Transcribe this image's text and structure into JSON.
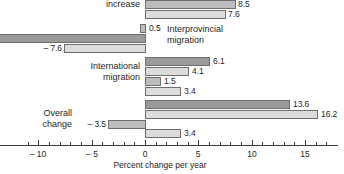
{
  "chart_data": {
    "type": "bar",
    "orientation": "horizontal",
    "title": "",
    "xlabel": "Percent change per year",
    "ylabel": "",
    "xlim": [
      -11.5,
      17.2
    ],
    "grid": false,
    "legend": "none",
    "tick_labels": [
      "-10",
      "-5",
      "0",
      "5",
      "10",
      "15"
    ],
    "tick_values": [
      -10,
      -5,
      0,
      5,
      10,
      15
    ],
    "minor_tick_step": 1,
    "zero_line": 0,
    "categories": [
      "increase",
      "Interprovincial migration",
      "International migration",
      "Overall change"
    ],
    "groups": [
      {
        "label": "increase",
        "label_side": "left",
        "clipped_top": true,
        "bars": [
          {
            "value": 11.2,
            "label": "",
            "shade": "dark",
            "visible_partial": true
          },
          {
            "value": 8.5,
            "label": "8.5",
            "shade": "mid"
          },
          {
            "value": 7.6,
            "label": "7.6",
            "shade": "light"
          }
        ]
      },
      {
        "label": "Interprovincial migration",
        "label_side": "right",
        "bars": [
          {
            "value": 0.5,
            "label": "0.5",
            "shade": "mid"
          },
          {
            "value": -13.0,
            "label": "",
            "shade": "dark",
            "clipped_left": true
          },
          {
            "value": -7.6,
            "label": "-7.6",
            "shade": "light"
          }
        ]
      },
      {
        "label": "International migration",
        "label_side": "left",
        "bars": [
          {
            "value": 6.1,
            "label": "6.1",
            "shade": "dark"
          },
          {
            "value": 4.1,
            "label": "4.1",
            "shade": "light"
          },
          {
            "value": 1.5,
            "label": "1.5",
            "shade": "mid"
          },
          {
            "value": 3.4,
            "label": "3.4",
            "shade": "light"
          }
        ]
      },
      {
        "label": "Overall change",
        "label_side": "left",
        "bars": [
          {
            "value": 13.6,
            "label": "13.6",
            "shade": "dark"
          },
          {
            "value": 16.2,
            "label": "16.2",
            "shade": "light"
          },
          {
            "value": -3.5,
            "label": "-3.5",
            "shade": "mid"
          },
          {
            "value": 3.4,
            "label": "3.4",
            "shade": "light"
          }
        ]
      }
    ]
  },
  "labels": {
    "group1_line1": "increase",
    "group2_line1": "Interprovincial",
    "group2_line2": "migration",
    "group3_line1": "International",
    "group3_line2": "migration",
    "group4_line1": "Overall",
    "group4_line2": "change"
  },
  "values": {
    "g1_b2": "8.5",
    "g1_b3": "7.6",
    "g2_b1": "0.5",
    "g2_b3": "– 7.6",
    "g3_b1": "6.1",
    "g3_b2": "4.1",
    "g3_b3": "1.5",
    "g3_b4": "3.4",
    "g4_b1": "13.6",
    "g4_b2": "16.2",
    "g4_b3": "– 3.5",
    "g4_b4": "3.4"
  },
  "axis": {
    "t_neg10": "– 10",
    "t_neg5": "– 5",
    "t_0": "0",
    "t_5": "5",
    "t_10": "10",
    "t_15": "15",
    "title": "Percent change per year"
  },
  "colors": {
    "dark": "#9a9a9a",
    "mid": "#bcbcbc",
    "light": "#dcdcdc",
    "stroke": "#6e6e6e",
    "axis": "#3a3a3a",
    "text": "#1e1e1e"
  }
}
